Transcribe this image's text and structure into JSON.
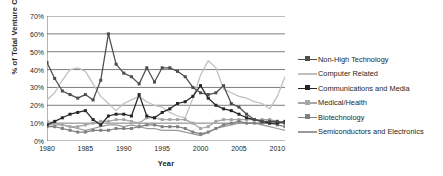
{
  "chart_data": {
    "type": "line",
    "title": "",
    "xlabel": "Year",
    "ylabel": "% of Total Venture Capital",
    "xlim": [
      1980,
      2011
    ],
    "ylim": [
      0,
      70
    ],
    "ytick_labels": [
      "0%",
      "10%",
      "20%",
      "30%",
      "40%",
      "50%",
      "60%",
      "70%"
    ],
    "ytick_values": [
      0,
      10,
      20,
      30,
      40,
      50,
      60,
      70
    ],
    "xtick_labels": [
      "1980",
      "1985",
      "1990",
      "1995",
      "2000",
      "2005",
      "2010"
    ],
    "xtick_values": [
      1980,
      1985,
      1990,
      1995,
      2000,
      2005,
      2010
    ],
    "grid": "horizontal",
    "legend_position": "right",
    "x": [
      1980,
      1981,
      1982,
      1983,
      1984,
      1985,
      1986,
      1987,
      1988,
      1989,
      1990,
      1991,
      1992,
      1993,
      1994,
      1995,
      1996,
      1997,
      1998,
      1999,
      2000,
      2001,
      2002,
      2003,
      2004,
      2005,
      2006,
      2007,
      2008,
      2009,
      2010,
      2011
    ],
    "series": [
      {
        "name": "Non-High Technology",
        "color": "#4d4d4d",
        "marker": "square",
        "values": [
          44,
          35,
          28,
          26,
          24,
          26,
          23,
          34,
          60,
          43,
          38,
          36,
          32,
          41,
          33,
          41,
          41,
          39,
          36,
          30,
          27,
          26,
          27,
          31,
          21,
          19,
          15,
          12,
          11,
          11,
          11,
          10
        ]
      },
      {
        "name": "Computer Related",
        "color": "#bfbfbf",
        "marker": "none",
        "values": [
          23,
          27,
          34,
          40,
          41,
          39,
          32,
          25,
          21,
          17,
          21,
          23,
          25,
          22,
          20,
          19,
          16,
          14,
          13,
          24,
          37,
          45,
          41,
          29,
          27,
          25,
          24,
          22,
          21,
          18,
          25,
          36
        ]
      },
      {
        "name": "Communications and Media",
        "color": "#262626",
        "marker": "square",
        "values": [
          9,
          11,
          13,
          15,
          16,
          17,
          12,
          9,
          14,
          15,
          15,
          14,
          26,
          14,
          13,
          16,
          18,
          21,
          22,
          25,
          31,
          24,
          20,
          18,
          17,
          15,
          13,
          12,
          11,
          10,
          10,
          11
        ]
      },
      {
        "name": "Medical/Health",
        "color": "#a6a6a6",
        "marker": "square",
        "values": [
          11,
          10,
          9,
          8,
          8,
          9,
          10,
          11,
          11,
          12,
          12,
          11,
          10,
          13,
          13,
          12,
          12,
          12,
          12,
          10,
          7,
          8,
          11,
          12,
          12,
          12,
          12,
          12,
          12,
          12,
          11,
          10
        ]
      },
      {
        "name": "Biotechnology",
        "color": "#808080",
        "marker": "square",
        "values": [
          8,
          8,
          7,
          6,
          5,
          5,
          6,
          6,
          6,
          7,
          7,
          7,
          8,
          9,
          9,
          8,
          8,
          8,
          7,
          5,
          4,
          5,
          7,
          9,
          10,
          11,
          10,
          10,
          10,
          10,
          9,
          8
        ]
      },
      {
        "name": "Semiconductors and Electronics",
        "color": "#999999",
        "marker": "none",
        "values": [
          9,
          9,
          9,
          8,
          7,
          6,
          7,
          8,
          9,
          9,
          8,
          9,
          8,
          7,
          7,
          6,
          6,
          6,
          5,
          4,
          3,
          5,
          7,
          8,
          9,
          10,
          10,
          10,
          9,
          8,
          7,
          6
        ]
      }
    ]
  }
}
